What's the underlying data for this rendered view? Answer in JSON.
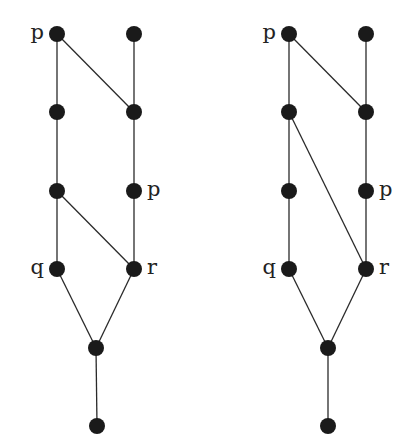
{
  "diagrams": [
    {
      "name": "left-lattice",
      "nodes": [
        {
          "id": "a",
          "x": 57,
          "y": 34,
          "label": "p",
          "label_side": "left"
        },
        {
          "id": "b",
          "x": 134,
          "y": 34,
          "label": "",
          "label_side": ""
        },
        {
          "id": "c",
          "x": 57,
          "y": 112,
          "label": "",
          "label_side": ""
        },
        {
          "id": "d",
          "x": 134,
          "y": 112,
          "label": "",
          "label_side": ""
        },
        {
          "id": "e",
          "x": 57,
          "y": 191,
          "label": "",
          "label_side": ""
        },
        {
          "id": "f",
          "x": 134,
          "y": 191,
          "label": "p",
          "label_side": "right"
        },
        {
          "id": "g",
          "x": 57,
          "y": 269,
          "label": "q",
          "label_side": "left"
        },
        {
          "id": "h",
          "x": 134,
          "y": 269,
          "label": "r",
          "label_side": "right"
        },
        {
          "id": "i",
          "x": 96,
          "y": 348,
          "label": "",
          "label_side": ""
        },
        {
          "id": "j",
          "x": 97,
          "y": 426,
          "label": "",
          "label_side": ""
        }
      ],
      "edges": [
        [
          "a",
          "c"
        ],
        [
          "a",
          "d"
        ],
        [
          "b",
          "d"
        ],
        [
          "c",
          "e"
        ],
        [
          "d",
          "f"
        ],
        [
          "e",
          "g"
        ],
        [
          "e",
          "h"
        ],
        [
          "f",
          "h"
        ],
        [
          "g",
          "i"
        ],
        [
          "h",
          "i"
        ],
        [
          "i",
          "j"
        ]
      ]
    },
    {
      "name": "right-lattice",
      "nodes": [
        {
          "id": "a",
          "x": 289,
          "y": 34,
          "label": "p",
          "label_side": "left"
        },
        {
          "id": "b",
          "x": 366,
          "y": 34,
          "label": "",
          "label_side": ""
        },
        {
          "id": "c",
          "x": 289,
          "y": 112,
          "label": "",
          "label_side": ""
        },
        {
          "id": "d",
          "x": 366,
          "y": 112,
          "label": "",
          "label_side": ""
        },
        {
          "id": "e",
          "x": 289,
          "y": 191,
          "label": "",
          "label_side": ""
        },
        {
          "id": "f",
          "x": 366,
          "y": 191,
          "label": "p",
          "label_side": "right"
        },
        {
          "id": "g",
          "x": 289,
          "y": 269,
          "label": "q",
          "label_side": "left"
        },
        {
          "id": "h",
          "x": 366,
          "y": 269,
          "label": "r",
          "label_side": "right"
        },
        {
          "id": "i",
          "x": 328,
          "y": 348,
          "label": "",
          "label_side": ""
        },
        {
          "id": "j",
          "x": 328,
          "y": 426,
          "label": "",
          "label_side": ""
        }
      ],
      "edges": [
        [
          "a",
          "c"
        ],
        [
          "a",
          "d"
        ],
        [
          "b",
          "d"
        ],
        [
          "c",
          "e"
        ],
        [
          "c",
          "h"
        ],
        [
          "d",
          "f"
        ],
        [
          "e",
          "g"
        ],
        [
          "f",
          "h"
        ],
        [
          "g",
          "i"
        ],
        [
          "h",
          "i"
        ],
        [
          "i",
          "j"
        ]
      ]
    }
  ],
  "style": {
    "node_radius": 8,
    "node_color": "#1a1a1a",
    "edge_color": "#2a2a2a"
  }
}
